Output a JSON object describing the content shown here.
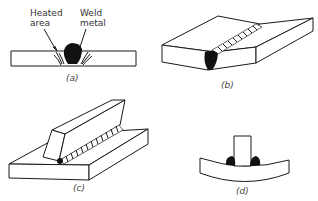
{
  "figure": {
    "panels": [
      {
        "id": "a",
        "caption": "(a)",
        "description": "Butt weld cross-section showing heated area and weld metal",
        "labels": {
          "heated_area_line1": "Heated",
          "heated_area_line2": "area",
          "weld_metal_line1": "Weld",
          "weld_metal_line2": "metal"
        }
      },
      {
        "id": "b",
        "caption": "(b)",
        "description": "Butt weld between two plates, angled distortion"
      },
      {
        "id": "c",
        "caption": "(c)",
        "description": "Fillet weld of inclined bar on plate"
      },
      {
        "id": "d",
        "caption": "(d)",
        "description": "T-joint double fillet weld causing plate bowing"
      }
    ],
    "colors": {
      "line": "#1a1a1a",
      "weld": "#111111",
      "background": "#ffffff"
    }
  }
}
